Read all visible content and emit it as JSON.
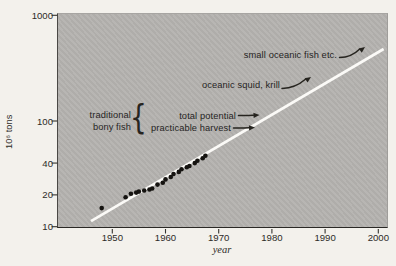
{
  "colors": {
    "page_background": "#f3f1ec",
    "plot_background": "#b5b3b0",
    "trend_line": "#fbfaf7",
    "data_point": "#151310",
    "text": "#26241f",
    "axis": "#2a2825"
  },
  "chart_data": {
    "type": "scatter",
    "title": "",
    "xlabel": "year",
    "ylabel": "10⁶ tons",
    "x_scale": "linear",
    "y_scale": "log",
    "xlim": [
      1939.5,
      2002
    ],
    "ylim": [
      10,
      1000
    ],
    "x_ticks": [
      1950,
      1960,
      1970,
      1980,
      1990,
      2000
    ],
    "y_ticks": [
      10,
      20,
      40,
      100,
      1000
    ],
    "grid": "off",
    "legend": "none",
    "series": [
      {
        "name": "recorded world fish harvest",
        "type": "scatter",
        "color": "#151310",
        "points": [
          [
            1948,
            15
          ],
          [
            1952.5,
            19
          ],
          [
            1953.5,
            20.5
          ],
          [
            1954.5,
            21
          ],
          [
            1955,
            21.5
          ],
          [
            1956,
            22
          ],
          [
            1957,
            22.5
          ],
          [
            1957.5,
            23
          ],
          [
            1958.5,
            25
          ],
          [
            1959.5,
            26
          ],
          [
            1960,
            28
          ],
          [
            1961,
            29.5
          ],
          [
            1961.5,
            31.5
          ],
          [
            1962.5,
            33
          ],
          [
            1963,
            35
          ],
          [
            1964,
            36.5
          ],
          [
            1964.5,
            37.5
          ],
          [
            1965.5,
            40
          ],
          [
            1966,
            42
          ],
          [
            1967,
            44.5
          ],
          [
            1967.5,
            47
          ]
        ]
      },
      {
        "name": "exponential growth trend",
        "type": "line",
        "color": "#fbfaf7",
        "points": [
          [
            1946,
            11.3
          ],
          [
            2001,
            480
          ]
        ]
      }
    ],
    "annotations": {
      "small_oceanic": "small oceanic fish etc.",
      "oceanic_squid": "oceanic squid, krill",
      "traditional_line1": "traditional",
      "traditional_line2": "bony fish",
      "brace": "{",
      "total_potential": "total potential",
      "practicable_harvest": "practicable harvest"
    }
  }
}
